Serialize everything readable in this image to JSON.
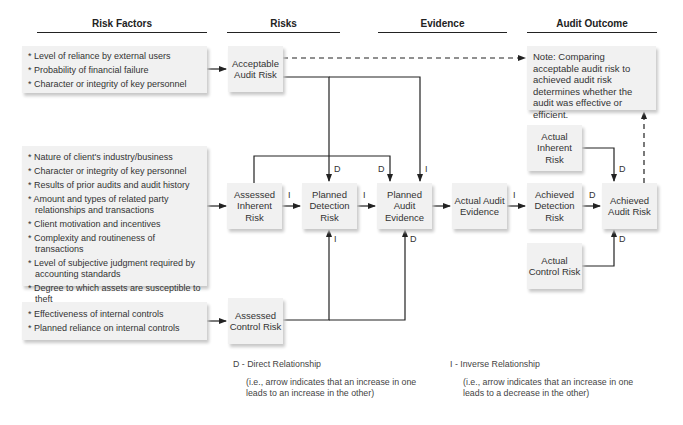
{
  "headers": {
    "risk_factors": "Risk Factors",
    "risks": "Risks",
    "evidence": "Evidence",
    "audit_outcome": "Audit Outcome"
  },
  "factor_groups": [
    {
      "items": [
        "Level of reliance by external users",
        "Probability of financial failure",
        "Character or integrity of key personnel"
      ]
    },
    {
      "items": [
        "Nature of client's industry/business",
        "Character or integrity of key personnel",
        "Results of prior audits and audit history",
        "Amount and types of related party relationships and transactions",
        "Client motivation and incentives",
        "Complexity and routineness of transactions",
        "Level of subjective judgment required by accounting standards",
        "Degree to which assets are susceptible to theft"
      ]
    },
    {
      "items": [
        "Effectiveness of internal controls",
        "Planned reliance on internal controls"
      ]
    }
  ],
  "nodes": {
    "acceptable_audit_risk": "Acceptable Audit Risk",
    "assessed_inherent_risk": "Assessed Inherent Risk",
    "planned_detection_risk": "Planned Detection Risk",
    "planned_audit_evidence": "Planned Audit Evidence",
    "actual_audit_evidence": "Actual Audit Evidence",
    "achieved_detection_risk": "Achieved Detection Risk",
    "achieved_audit_risk": "Achieved Audit Risk",
    "actual_inherent_risk": "Actual Inherent Risk",
    "actual_control_risk": "Actual Control Risk",
    "assessed_control_risk": "Assessed Control Risk"
  },
  "note": "Note: Comparing acceptable audit risk to achieved audit risk determines whether the audit was effective or efficient.",
  "edge_labels": {
    "d": "D",
    "i": "I"
  },
  "legend": {
    "direct_title": "D - Direct Relationship",
    "direct_desc": "(i.e., arrow indicates that an increase in one leads to an increase in the other)",
    "inverse_title": "I - Inverse Relationship",
    "inverse_desc": "(i.e., arrow indicates that an increase in one leads to a decrease in the other)"
  },
  "colors": {
    "box_fill": "#f1f1f1",
    "line": "#222222",
    "text": "#333333"
  }
}
